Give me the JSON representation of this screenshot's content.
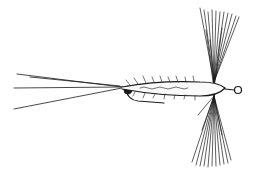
{
  "image": {
    "subject": "fishing fly illustration",
    "style": "black ink line drawing",
    "width": 254,
    "height": 175,
    "colors": {
      "background": "#ffffff",
      "ink": "#1a1a1a"
    }
  }
}
